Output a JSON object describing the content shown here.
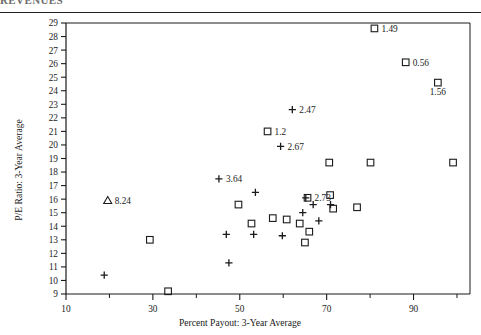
{
  "page": {
    "header_partial_text": "REVENUES",
    "divider": true
  },
  "chart_data": {
    "type": "scatter",
    "title": "",
    "xlabel": "Percent Payout: 3-Year Average",
    "ylabel": "P/E Ratio: 3-Year Average",
    "xlim": [
      10,
      103
    ],
    "ylim": [
      9,
      29
    ],
    "xticks": [
      10,
      30,
      50,
      70,
      90
    ],
    "xticklabels": [
      "10",
      "30",
      "50",
      "70",
      "90"
    ],
    "xminorticks": [
      20,
      40,
      60,
      80,
      100
    ],
    "yticks": [
      9,
      10,
      11,
      12,
      13,
      14,
      15,
      16,
      17,
      18,
      19,
      20,
      21,
      22,
      23,
      24,
      25,
      26,
      27,
      28,
      29
    ],
    "yticklabels": [
      "9",
      "10",
      "11",
      "12",
      "13",
      "14",
      "15",
      "16",
      "17",
      "18",
      "19",
      "20",
      "21",
      "22",
      "23",
      "24",
      "25",
      "26",
      "27",
      "28",
      "29"
    ],
    "grid": false,
    "legend": "none",
    "markers": [
      "square",
      "plus",
      "triangle"
    ],
    "series": [
      {
        "name": "square",
        "marker": "square",
        "points": [
          {
            "x": 81.0,
            "y": 28.6,
            "label": "1.49",
            "label_pos": "right"
          },
          {
            "x": 88.2,
            "y": 26.1,
            "label": "0.56",
            "label_pos": "right"
          },
          {
            "x": 95.6,
            "y": 24.6,
            "label": "1.56",
            "label_pos": "below"
          },
          {
            "x": 56.4,
            "y": 21.0,
            "label": "1.2",
            "label_pos": "right"
          },
          {
            "x": 70.6,
            "y": 18.7,
            "label": "",
            "label_pos": ""
          },
          {
            "x": 80.1,
            "y": 18.7,
            "label": "",
            "label_pos": ""
          },
          {
            "x": 99.1,
            "y": 18.7,
            "label": "",
            "label_pos": ""
          },
          {
            "x": 65.6,
            "y": 16.1,
            "label": "2.73",
            "label_pos": "right"
          },
          {
            "x": 70.8,
            "y": 16.3,
            "label": "",
            "label_pos": ""
          },
          {
            "x": 49.7,
            "y": 15.6,
            "label": "",
            "label_pos": ""
          },
          {
            "x": 71.5,
            "y": 15.3,
            "label": "",
            "label_pos": ""
          },
          {
            "x": 77.0,
            "y": 15.4,
            "label": "",
            "label_pos": ""
          },
          {
            "x": 57.6,
            "y": 14.6,
            "label": "",
            "label_pos": ""
          },
          {
            "x": 60.8,
            "y": 14.5,
            "label": "",
            "label_pos": ""
          },
          {
            "x": 52.7,
            "y": 14.2,
            "label": "",
            "label_pos": ""
          },
          {
            "x": 63.8,
            "y": 14.2,
            "label": "",
            "label_pos": ""
          },
          {
            "x": 66.0,
            "y": 13.6,
            "label": "",
            "label_pos": ""
          },
          {
            "x": 65.0,
            "y": 12.8,
            "label": "",
            "label_pos": ""
          },
          {
            "x": 29.3,
            "y": 13.0,
            "label": "",
            "label_pos": ""
          },
          {
            "x": 33.5,
            "y": 9.2,
            "label": "",
            "label_pos": ""
          }
        ]
      },
      {
        "name": "plus",
        "marker": "plus",
        "points": [
          {
            "x": 62.1,
            "y": 22.6,
            "label": "2.47",
            "label_pos": "right"
          },
          {
            "x": 59.4,
            "y": 19.9,
            "label": "2.67",
            "label_pos": "right"
          },
          {
            "x": 45.2,
            "y": 17.5,
            "label": "3.64",
            "label_pos": "right"
          },
          {
            "x": 65.2,
            "y": 16.1,
            "label": "",
            "label_pos": ""
          },
          {
            "x": 53.6,
            "y": 16.5,
            "label": "",
            "label_pos": ""
          },
          {
            "x": 66.9,
            "y": 15.6,
            "label": "",
            "label_pos": ""
          },
          {
            "x": 70.9,
            "y": 15.6,
            "label": "",
            "label_pos": ""
          },
          {
            "x": 64.5,
            "y": 15.0,
            "label": "",
            "label_pos": ""
          },
          {
            "x": 68.2,
            "y": 14.4,
            "label": "",
            "label_pos": ""
          },
          {
            "x": 46.9,
            "y": 13.4,
            "label": "",
            "label_pos": ""
          },
          {
            "x": 53.2,
            "y": 13.4,
            "label": "",
            "label_pos": ""
          },
          {
            "x": 59.8,
            "y": 13.3,
            "label": "",
            "label_pos": ""
          },
          {
            "x": 47.5,
            "y": 11.3,
            "label": "",
            "label_pos": ""
          },
          {
            "x": 18.8,
            "y": 10.4,
            "label": "",
            "label_pos": ""
          }
        ]
      },
      {
        "name": "triangle",
        "marker": "triangle",
        "points": [
          {
            "x": 19.6,
            "y": 15.9,
            "label": "8.24",
            "label_pos": "right"
          }
        ]
      }
    ]
  }
}
